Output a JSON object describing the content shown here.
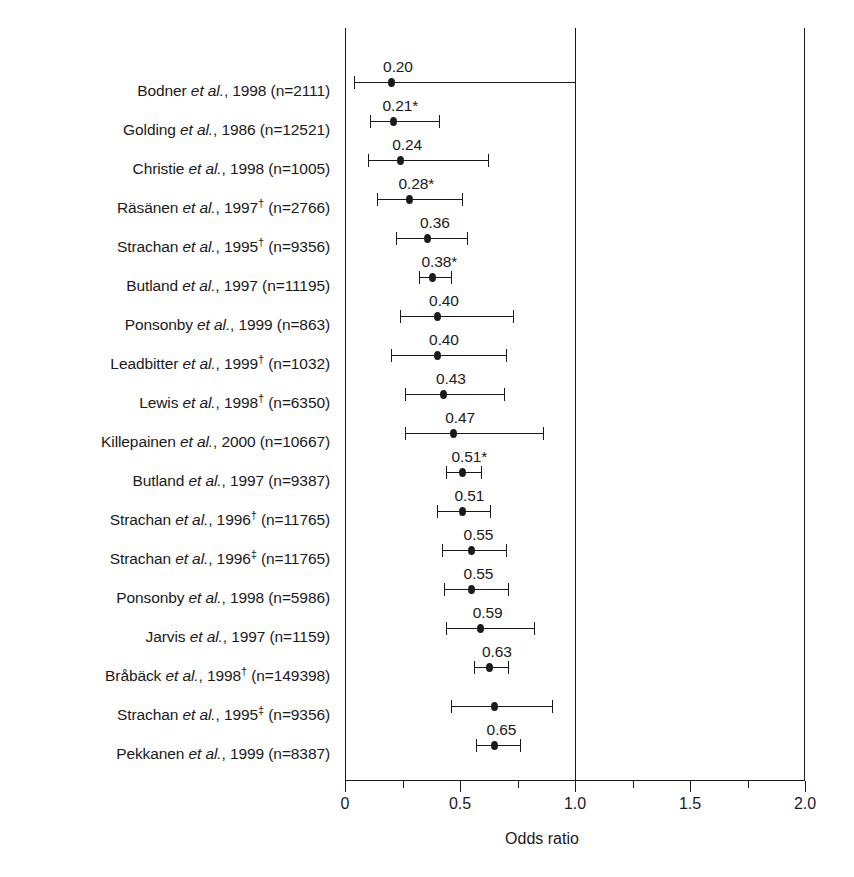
{
  "chart_data": {
    "type": "forest",
    "title": "",
    "xlabel": "Odds ratio",
    "ylabel": "",
    "xlim": [
      0,
      2.0
    ],
    "reference_line": 1.0,
    "grid": false,
    "legend": "none",
    "tick_labels": [
      "0",
      "0.5",
      "1.0",
      "1.5",
      "2.0"
    ],
    "tick_values": [
      0,
      0.5,
      1.0,
      1.5,
      2.0
    ],
    "minor_tick_values": [
      0.25,
      0.75,
      1.25,
      1.75
    ],
    "rows": [
      {
        "label_author": "Bodner",
        "label_etal": "et al.",
        "label_year": "1998",
        "label_dagger": "",
        "label_n": "(n=2111)",
        "value": 0.2,
        "value_label": "0.20",
        "ci_low": 0.04,
        "ci_high": 1.0
      },
      {
        "label_author": "Golding",
        "label_etal": "et al.",
        "label_year": "1986",
        "label_dagger": "",
        "label_n": "(n=12521)",
        "value": 0.21,
        "value_label": "0.21*",
        "ci_low": 0.11,
        "ci_high": 0.41
      },
      {
        "label_author": "Christie",
        "label_etal": "et al.",
        "label_year": "1998",
        "label_dagger": "",
        "label_n": "(n=1005)",
        "value": 0.24,
        "value_label": "0.24",
        "ci_low": 0.1,
        "ci_high": 0.62
      },
      {
        "label_author": "Räsänen ",
        "label_etal": "et al.",
        "label_year": "1997",
        "label_dagger": "†",
        "label_n": "(n=2766)",
        "value": 0.28,
        "value_label": "0.28*",
        "ci_low": 0.14,
        "ci_high": 0.51
      },
      {
        "label_author": "Strachan",
        "label_etal": "et al.",
        "label_year": "1995",
        "label_dagger": "†",
        "label_n": "(n=9356)",
        "value": 0.36,
        "value_label": "0.36",
        "ci_low": 0.22,
        "ci_high": 0.53
      },
      {
        "label_author": "Butland",
        "label_etal": "et al.",
        "label_year": "1997",
        "label_dagger": "",
        "label_n": "(n=11195)",
        "value": 0.38,
        "value_label": "0.38*",
        "ci_low": 0.32,
        "ci_high": 0.46
      },
      {
        "label_author": "Ponsonby",
        "label_etal": "et al.",
        "label_year": "1999",
        "label_dagger": "",
        "label_n": "(n=863)",
        "value": 0.4,
        "value_label": "0.40",
        "ci_low": 0.24,
        "ci_high": 0.73
      },
      {
        "label_author": "Leadbitter",
        "label_etal": "et al.",
        "label_year": "1999",
        "label_dagger": "†",
        "label_n": "(n=1032)",
        "value": 0.4,
        "value_label": "0.40",
        "ci_low": 0.2,
        "ci_high": 0.7
      },
      {
        "label_author": "Lewis",
        "label_etal": "et al.",
        "label_year": "1998",
        "label_dagger": "†",
        "label_n": "(n=6350)",
        "value": 0.43,
        "value_label": "0.43",
        "ci_low": 0.26,
        "ci_high": 0.69
      },
      {
        "label_author": "Killepainen",
        "label_etal": "et al.",
        "label_year": "2000",
        "label_dagger": "",
        "label_n": "(n=10667)",
        "value": 0.47,
        "value_label": "0.47",
        "ci_low": 0.26,
        "ci_high": 0.86
      },
      {
        "label_author": "Butland",
        "label_etal": "et al.",
        "label_year": "1997",
        "label_dagger": "",
        "label_n": "(n=9387)",
        "value": 0.51,
        "value_label": "0.51*",
        "ci_low": 0.44,
        "ci_high": 0.59
      },
      {
        "label_author": "Strachan",
        "label_etal": "et al.",
        "label_year": "1996",
        "label_dagger": "†",
        "label_n": "(n=11765)",
        "value": 0.51,
        "value_label": "0.51",
        "ci_low": 0.4,
        "ci_high": 0.63
      },
      {
        "label_author": "Strachan",
        "label_etal": "et al.",
        "label_year": "1996",
        "label_dagger": "‡",
        "label_n": "(n=11765)",
        "value": 0.55,
        "value_label": "0.55",
        "ci_low": 0.42,
        "ci_high": 0.7
      },
      {
        "label_author": "Ponsonby",
        "label_etal": "et al.",
        "label_year": "1998",
        "label_dagger": "",
        "label_n": "(n=5986)",
        "value": 0.55,
        "value_label": "0.55",
        "ci_low": 0.43,
        "ci_high": 0.71
      },
      {
        "label_author": "Jarvis",
        "label_etal": "et al.",
        "label_year": "1997",
        "label_dagger": "",
        "label_n": "(n=1159)",
        "value": 0.59,
        "value_label": "0.59",
        "ci_low": 0.44,
        "ci_high": 0.82
      },
      {
        "label_author": "Bråbäck",
        "label_etal": "et al.",
        "label_year": "1998",
        "label_dagger": "†",
        "label_n": "(n=149398)",
        "value": 0.63,
        "value_label": "0.63",
        "ci_low": 0.56,
        "ci_high": 0.71
      },
      {
        "label_author": "Strachan",
        "label_etal": "et al.",
        "label_year": "1995",
        "label_dagger": "‡",
        "label_n": "(n=9356)",
        "value": 0.65,
        "value_label": "",
        "ci_low": 0.46,
        "ci_high": 0.9
      },
      {
        "label_author": "Pekkanen",
        "label_etal": "et al.",
        "label_year": "1999",
        "label_dagger": "",
        "label_n": "(n=8387)",
        "value": 0.65,
        "value_label": "0.65",
        "ci_low": 0.57,
        "ci_high": 0.76
      }
    ]
  },
  "colors": {
    "ink": "#1a1a1a",
    "background": "#ffffff"
  }
}
